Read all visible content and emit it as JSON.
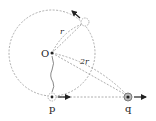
{
  "diagram": {
    "type": "physics-geometry",
    "labels": {
      "center": "O",
      "radius": "r",
      "distance": "2r",
      "point_p": "p",
      "point_q": "q"
    },
    "colors": {
      "stroke": "#555555",
      "dashed": "#888888",
      "ink": "#222222"
    },
    "elements": [
      {
        "id": "circle",
        "kind": "dashed-circle",
        "center": "O"
      },
      {
        "id": "point-top",
        "kind": "hollow-point-on-circle",
        "arrow": "tangent-up-left"
      },
      {
        "id": "point-p",
        "kind": "dotted-circle-point",
        "arrow": "right"
      },
      {
        "id": "point-q",
        "kind": "filled-ring-point",
        "arrow": "right"
      },
      {
        "id": "radius-line",
        "kind": "dashed-line",
        "from": "O",
        "to": "point-top",
        "label": "r"
      },
      {
        "id": "distance-line",
        "kind": "dashed-line",
        "from": "O",
        "to": "point-q",
        "label": "2r"
      },
      {
        "id": "pq-line",
        "kind": "dashed-line",
        "from": "point-p",
        "to": "point-q"
      },
      {
        "id": "wavy-line",
        "kind": "wavy-line",
        "from": "O",
        "to": "point-p"
      }
    ]
  }
}
